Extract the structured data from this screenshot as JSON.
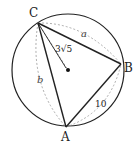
{
  "diagram": {
    "circle": {
      "cx": 68,
      "cy": 70,
      "r": 56
    },
    "center": {
      "x": 68,
      "y": 70
    },
    "points": {
      "A": {
        "x": 66,
        "y": 127,
        "label": "A"
      },
      "B": {
        "x": 121,
        "y": 64,
        "label": "B"
      },
      "C": {
        "x": 38,
        "y": 23,
        "label": "C"
      }
    },
    "sides": {
      "a": "a",
      "b": "b",
      "c": "10"
    },
    "radius_label": "3√5",
    "colors": {
      "stroke": "#222222",
      "dashed": "#999999"
    }
  }
}
